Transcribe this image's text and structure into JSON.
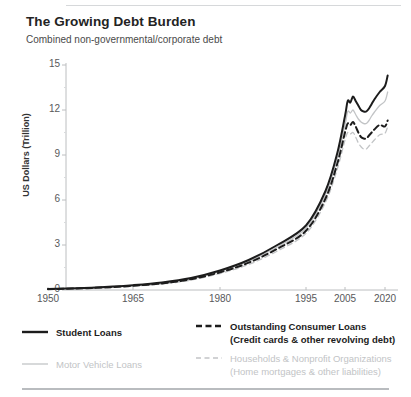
{
  "header": {
    "title": "The Growing Debt Burden",
    "subtitle": "Combined non-governmental/corporate debt"
  },
  "colors": {
    "dark": "#1c1c1c",
    "light": "#c2c4c6",
    "axis": "#bcbec0",
    "tick_text": "#58595b",
    "rule": "#d6d8da"
  },
  "legend": {
    "items": [
      {
        "label": "Student Loans",
        "label2": "",
        "style": "solid",
        "tone": "dark"
      },
      {
        "label": "Outstanding Consumer Loans",
        "label2": "(Credit cards & other revolving debt)",
        "style": "dashed",
        "tone": "dark"
      },
      {
        "label": "Motor Vehicle Loans",
        "label2": "",
        "style": "solid",
        "tone": "light"
      },
      {
        "label": "Households & Nonprofit Organizations",
        "label2": "(Home mortgages & other liabilities)",
        "style": "dashed",
        "tone": "light"
      }
    ]
  },
  "chart_data": {
    "type": "line",
    "title": "The Growing Debt Burden",
    "subtitle": "Combined non-governmental/corporate debt",
    "xlabel": "",
    "ylabel": "US Dollars (Trillion)",
    "ylim": [
      0,
      15
    ],
    "yticks": [
      0,
      3,
      6,
      9,
      12,
      15
    ],
    "xticks": [
      1950,
      1965,
      1980,
      1995,
      2005,
      2020
    ],
    "xlim": [
      1950,
      2022
    ],
    "grid": false,
    "legend_position": "below",
    "x": [
      1950,
      1955,
      1960,
      1965,
      1970,
      1975,
      1980,
      1985,
      1990,
      1995,
      2000,
      2003,
      2005,
      2006,
      2007,
      2008,
      2009,
      2010,
      2011,
      2012,
      2013,
      2014,
      2015,
      2016,
      2018,
      2020,
      2021
    ],
    "series": [
      {
        "name": "Student Loans",
        "style": "solid",
        "tone": "dark",
        "values": [
          0.07,
          0.12,
          0.2,
          0.32,
          0.5,
          0.8,
          1.3,
          2.0,
          3.0,
          4.3,
          6.6,
          9.1,
          11.6,
          12.6,
          12.5,
          12.9,
          12.6,
          12.3,
          12.0,
          11.9,
          11.9,
          12.1,
          12.4,
          12.7,
          13.2,
          13.6,
          14.3
        ]
      },
      {
        "name": "Outstanding Consumer Loans",
        "style": "dashed",
        "tone": "dark",
        "values": [
          0.05,
          0.1,
          0.17,
          0.28,
          0.44,
          0.72,
          1.18,
          1.82,
          2.75,
          3.95,
          6.1,
          8.4,
          10.5,
          11.1,
          11.0,
          11.2,
          10.9,
          10.5,
          10.2,
          10.1,
          10.1,
          10.3,
          10.5,
          10.7,
          11.0,
          10.9,
          11.3
        ]
      },
      {
        "name": "Motor Vehicle Loans",
        "style": "solid",
        "tone": "light",
        "values": [
          0.06,
          0.11,
          0.19,
          0.3,
          0.47,
          0.76,
          1.24,
          1.91,
          2.87,
          4.12,
          6.35,
          8.75,
          11.0,
          11.9,
          11.8,
          12.0,
          11.7,
          11.4,
          11.2,
          11.1,
          11.1,
          11.3,
          11.6,
          11.85,
          12.3,
          12.6,
          13.2
        ]
      },
      {
        "name": "Households & Nonprofit Organizations",
        "style": "dashed",
        "tone": "light",
        "values": [
          0.04,
          0.09,
          0.15,
          0.25,
          0.4,
          0.66,
          1.1,
          1.7,
          2.6,
          3.78,
          5.85,
          8.05,
          10.0,
          10.5,
          10.4,
          10.5,
          10.2,
          9.8,
          9.55,
          9.4,
          9.4,
          9.6,
          9.8,
          10.0,
          10.35,
          10.45,
          10.9
        ]
      }
    ]
  }
}
